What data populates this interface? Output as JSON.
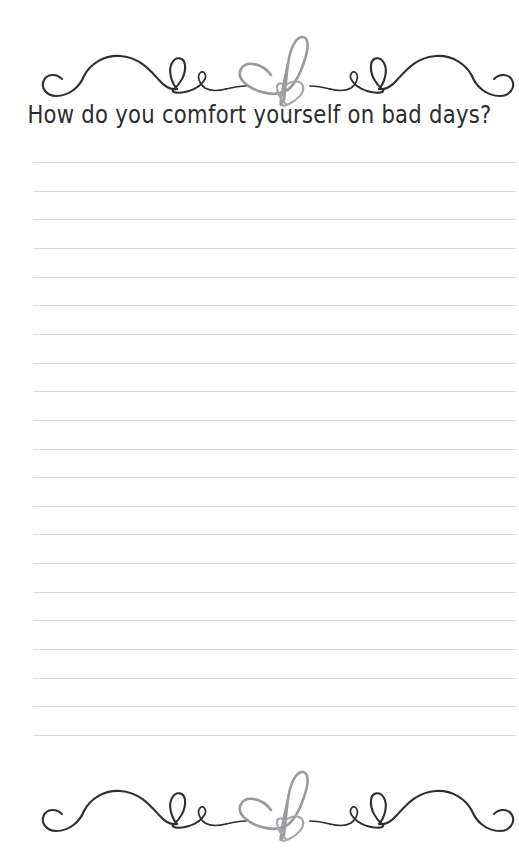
{
  "page": {
    "background_color": "#ffffff",
    "width": 519,
    "height": 862
  },
  "header_ornament": {
    "name": "decorative-flourish-with-hearts",
    "stroke_color": "#2f2f33",
    "heart_color": "#9a9a9e",
    "description": "Calligraphic swirl divider with two overlapping hand-drawn hearts at center"
  },
  "prompt": {
    "title": "How do you comfort yourself on bad days?",
    "text_color": "#2b2b2e"
  },
  "writing_area": {
    "line_color": "#d9d9dc",
    "line_count": 21,
    "first_line_y": 162,
    "line_spacing": 28.65,
    "line_left": 33,
    "line_right": 516
  },
  "footer_ornament": {
    "name": "decorative-flourish-with-hearts",
    "stroke_color": "#2f2f33",
    "heart_color": "#9a9a9e",
    "description": "Calligraphic swirl divider with two overlapping hand-drawn hearts at center"
  }
}
